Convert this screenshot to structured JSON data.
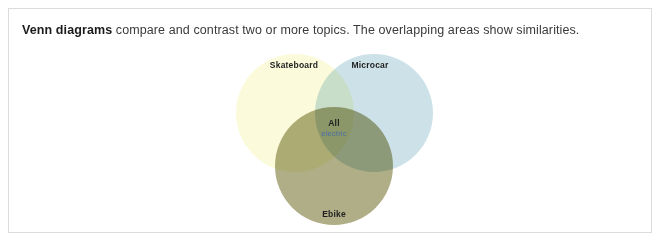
{
  "caption": {
    "lead": "Venn diagrams",
    "rest": " compare and contrast two or more topics. The overlapping areas show similarities."
  },
  "chart_data": {
    "type": "venn",
    "title": "Venn diagrams",
    "sets": [
      {
        "id": "skateboard",
        "label": "Skateboard",
        "color": "#fbfbdc",
        "position": "top-left"
      },
      {
        "id": "microcar",
        "label": "Microcar",
        "color": "#cde2e8",
        "position": "top-right"
      },
      {
        "id": "ebike",
        "label": "Ebike",
        "color": "#b0ae86",
        "position": "bottom-center"
      }
    ],
    "intersections": [
      {
        "sets": [
          "skateboard",
          "microcar",
          "ebike"
        ],
        "label": "All",
        "sublabel": "electric",
        "sublabel_color": "#4a6fa5",
        "color": "#d2e3d3"
      },
      {
        "sets": [
          "skateboard",
          "microcar"
        ],
        "color": "#dceadf"
      },
      {
        "sets": [
          "skateboard",
          "ebike"
        ],
        "color": "#d3d2ad"
      },
      {
        "sets": [
          "microcar",
          "ebike"
        ],
        "color": "#bdd7c2"
      }
    ],
    "legend": "none",
    "grid": false
  }
}
